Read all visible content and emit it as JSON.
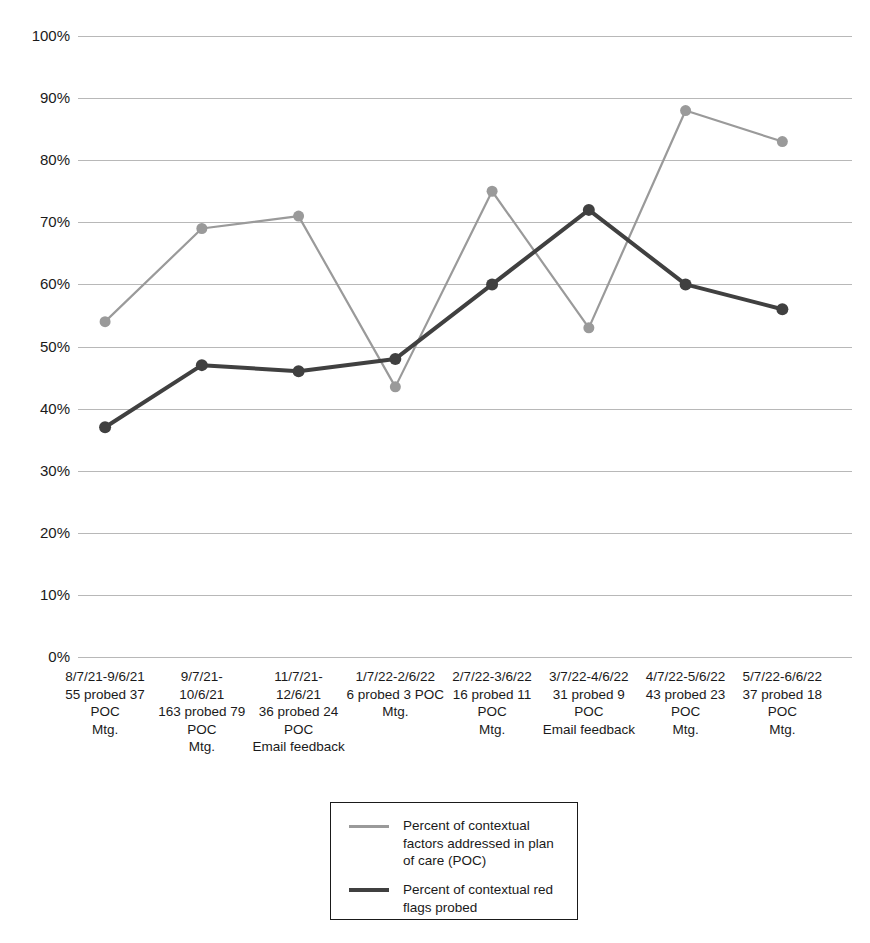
{
  "chart_data": {
    "type": "line",
    "title": "",
    "xlabel": "",
    "ylabel": "",
    "ylim": [
      0,
      100
    ],
    "grid": true,
    "legend_position": "bottom-center",
    "y_ticks": [
      "0%",
      "10%",
      "20%",
      "30%",
      "40%",
      "50%",
      "60%",
      "70%",
      "80%",
      "90%",
      "100%"
    ],
    "y_tick_values": [
      0,
      10,
      20,
      30,
      40,
      50,
      60,
      70,
      80,
      90,
      100
    ],
    "categories": [
      "8/7/21-9/6/21 55 probed 37 POC Mtg.",
      "9/7/21-10/6/21 163 probed 79 POC Mtg.",
      "11/7/21-12/6/21 36 probed 24 POC Email feedback",
      "1/7/22-2/6/22 6 probed 3 POC Mtg.",
      "2/7/22-3/6/22 16 probed 11 POC Mtg.",
      "3/7/22-4/6/22 31 probed 9 POC Email feedback",
      "4/7/22-5/6/22 43 probed 23 POC Mtg.",
      "5/7/22-6/6/22 37 probed 18 POC Mtg."
    ],
    "category_lines": [
      [
        "8/7/21-9/6/21",
        "55 probed 37",
        "POC",
        "Mtg."
      ],
      [
        "9/7/21-",
        "10/6/21",
        "163 probed 79",
        "POC",
        "Mtg."
      ],
      [
        "11/7/21-",
        "12/6/21",
        "36 probed 24",
        "POC",
        "Email feedback"
      ],
      [
        "1/7/22-2/6/22",
        "6 probed 3 POC",
        "Mtg."
      ],
      [
        "2/7/22-3/6/22",
        "16 probed 11",
        "POC",
        "Mtg."
      ],
      [
        "3/7/22-4/6/22",
        "31 probed 9",
        "POC",
        "Email feedback"
      ],
      [
        "4/7/22-5/6/22",
        "43 probed 23",
        "POC",
        "Mtg."
      ],
      [
        "5/7/22-6/6/22",
        "37 probed 18",
        "POC",
        "Mtg."
      ]
    ],
    "series": [
      {
        "name": "Percent of contextual factors addressed in plan of care (POC)",
        "color": "#9a9a9a",
        "values": [
          54,
          69,
          71,
          43.5,
          75,
          53,
          88,
          83
        ]
      },
      {
        "name": "Percent of contextual red flags probed",
        "color": "#404040",
        "values": [
          37,
          47,
          46,
          48,
          60,
          72,
          60,
          56
        ]
      }
    ]
  },
  "legend": {
    "items": [
      {
        "label": "Percent of contextual factors addressed in plan of care (POC)",
        "color": "#9a9a9a"
      },
      {
        "label": "Percent of contextual red flags probed",
        "color": "#404040"
      }
    ]
  }
}
